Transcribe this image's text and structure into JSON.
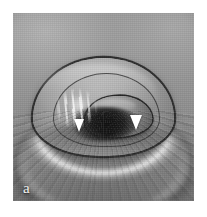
{
  "figure": {
    "panel_label": "a",
    "modality": "endoscopic grayscale photograph",
    "orientation": "en-face endoscopic view",
    "background_color": "#ffffff",
    "palette": {
      "paper_white": "#ffffff",
      "panel_light_gray": "#a8a8a8",
      "panel_mid_gray": "#8f8f8f",
      "panel_lower_gray": "#6e6e6e",
      "shadow_dark": "#1a1a1a",
      "outline_black": "#2c2c2c",
      "specular_white": "#ffffff",
      "label_color": "#f2f2f2",
      "arrow_color": "#ffffff"
    },
    "panel": {
      "x": 13,
      "y": 13,
      "width": 181,
      "height": 188
    },
    "annotations": [
      {
        "name": "arrowhead-left",
        "shape": "solid downward triangle",
        "color": "#ffffff",
        "x": 74,
        "y": 119,
        "width": 11,
        "height": 13
      },
      {
        "name": "arrowhead-right",
        "shape": "solid downward triangle",
        "color": "#ffffff",
        "x": 130,
        "y": 115,
        "width": 12,
        "height": 15
      }
    ],
    "features": [
      {
        "name": "top-specular-arch",
        "description": "bright curved light reflection band sweeping across the upper third"
      },
      {
        "name": "large-elliptical-fold",
        "description": "dome shaped mucosal fold outlined by a dark rim occupying the middle of the frame"
      },
      {
        "name": "inner-ring",
        "description": "second darker concentric rim inside the main fold"
      },
      {
        "name": "central-lobe",
        "description": "tongue shaped lobe projecting toward the lower right centre"
      },
      {
        "name": "dark-cleft",
        "description": "deep dark opening beneath the central lobe"
      },
      {
        "name": "specular-streaks",
        "description": "cluster of bright vertical glare streaks on the left side of the fold"
      },
      {
        "name": "radial-striations",
        "description": "fine radiating linear shadows fanning downward across the lower half"
      },
      {
        "name": "corner-vignette",
        "description": "gradual darkening toward the image corners"
      }
    ]
  }
}
